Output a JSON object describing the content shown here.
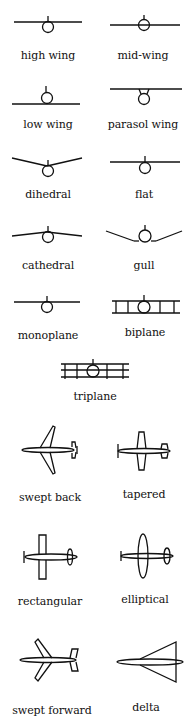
{
  "colors": {
    "ink": "#111111",
    "background": "#ffffff"
  },
  "sections": {
    "wing_position": [
      {
        "label": "high wing",
        "icon": "high-wing-icon"
      },
      {
        "label": "mid-wing",
        "icon": "mid-wing-icon"
      },
      {
        "label": "low wing",
        "icon": "low-wing-icon"
      },
      {
        "label": "parasol wing",
        "icon": "parasol-wing-icon"
      }
    ],
    "dihedral": [
      {
        "label": "dihedral",
        "icon": "dihedral-icon"
      },
      {
        "label": "flat",
        "icon": "flat-wing-icon"
      },
      {
        "label": "cathedral",
        "icon": "cathedral-icon"
      },
      {
        "label": "gull",
        "icon": "gull-wing-icon"
      }
    ],
    "planes": [
      {
        "label": "monoplane",
        "icon": "monoplane-icon"
      },
      {
        "label": "biplane",
        "icon": "biplane-icon"
      },
      {
        "label": "triplane",
        "icon": "triplane-icon"
      }
    ],
    "planform": [
      {
        "label": "swept back",
        "icon": "swept-back-icon"
      },
      {
        "label": "tapered",
        "icon": "tapered-wing-icon"
      },
      {
        "label": "rectangular",
        "icon": "rectangular-wing-icon"
      },
      {
        "label": "elliptical",
        "icon": "elliptical-wing-icon"
      },
      {
        "label": "swept forward",
        "icon": "swept-forward-icon"
      },
      {
        "label": "delta",
        "icon": "delta-wing-icon"
      }
    ]
  }
}
